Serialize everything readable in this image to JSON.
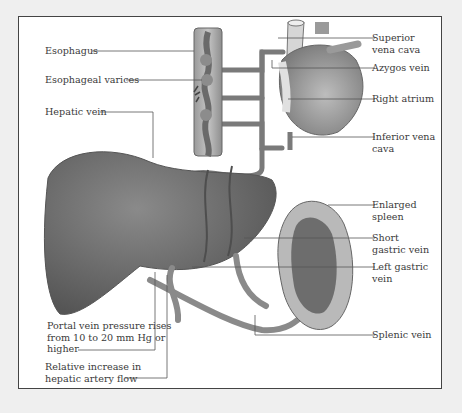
{
  "figure": {
    "colors": {
      "background": "#efefef",
      "frame_fill": "#ffffff",
      "frame_border": "#444444",
      "liver": "#6e6e6e",
      "organ_light": "#c8c8c8",
      "vessel": "#8a8a8a",
      "leader_line": "#555555",
      "text": "#3a3a3a"
    },
    "labels_left": [
      {
        "id": "esophagus",
        "text": "Esophagus"
      },
      {
        "id": "esophageal-varices",
        "text": "Esophageal varices"
      },
      {
        "id": "hepatic-vein",
        "text": "Hepatic vein"
      },
      {
        "id": "portal-pressure",
        "text": "Portal vein pressure rises\nfrom 10 to 20 mm Hg or\nhigher"
      },
      {
        "id": "hepatic-artery",
        "text": "Relative increase in\nhepatic artery flow"
      }
    ],
    "labels_right": [
      {
        "id": "superior-vena-cava",
        "text": "Superior\nvena cava"
      },
      {
        "id": "azygos-vein",
        "text": "Azygos vein"
      },
      {
        "id": "right-atrium",
        "text": "Right atrium"
      },
      {
        "id": "inferior-vena-cava",
        "text": "Inferior vena\ncava"
      },
      {
        "id": "enlarged-spleen",
        "text": "Enlarged\nspleen"
      },
      {
        "id": "short-gastric-vein",
        "text": "Short\ngastric vein"
      },
      {
        "id": "left-gastric-vein",
        "text": "Left gastric\nvein"
      },
      {
        "id": "splenic-vein",
        "text": "Splenic vein"
      }
    ]
  }
}
